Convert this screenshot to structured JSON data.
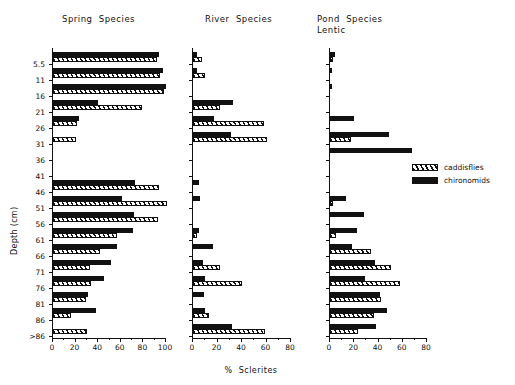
{
  "chart_data": {
    "type": "bar",
    "orientation": "horizontal",
    "title": "",
    "xlabel": "% Sclerites",
    "ylabel": "Depth (cm)",
    "grid": false,
    "legend_position": "right",
    "categories": [
      "5.5",
      "11",
      "16",
      "21",
      "26",
      "31",
      "36",
      "41",
      "46",
      "51",
      "56",
      "61",
      "66",
      "71",
      "76",
      "81",
      "86",
      ">86"
    ],
    "legend": [
      {
        "name": "caddisflies",
        "fill": "hatched"
      },
      {
        "name": "chironomids",
        "fill": "solid"
      }
    ],
    "panels": [
      {
        "title": "Spring  Species",
        "xlim": [
          0,
          100
        ],
        "xticks": [
          0,
          20,
          40,
          60,
          80,
          100
        ],
        "xticklabels": [
          "0",
          "20",
          "40",
          "60",
          "80",
          "100"
        ],
        "series": [
          {
            "name": "chironomids",
            "values": [
              94,
              97,
              100,
              40,
              23,
              0,
              0,
              0,
              73,
              61,
              72,
              71,
              57,
              51,
              45,
              31,
              38,
              0
            ]
          },
          {
            "name": "caddisflies",
            "values": [
              92,
              95,
              98,
              79,
              21,
              20,
              0,
              0,
              94,
              101,
              93,
              57,
              42,
              33,
              34,
              29,
              16,
              30
            ]
          }
        ]
      },
      {
        "title": "River  Species",
        "xlim": [
          0,
          80
        ],
        "xticks": [
          0,
          20,
          40,
          60,
          80
        ],
        "xticklabels": [
          "0",
          "20",
          "40",
          "60",
          "80"
        ],
        "series": [
          {
            "name": "chironomids",
            "values": [
              3,
              3,
              0,
              33,
              17,
              31,
              0,
              0,
              5,
              6,
              0,
              5,
              16,
              8,
              10,
              9,
              10,
              32
            ]
          },
          {
            "name": "caddisflies",
            "values": [
              7,
              10,
              0,
              22,
              58,
              60,
              0,
              0,
              0,
              0,
              0,
              3,
              0,
              22,
              40,
              0,
              13,
              59
            ]
          }
        ]
      },
      {
        "title": "Pond  Species\nLentic",
        "xlim": [
          0,
          80
        ],
        "xticks": [
          0,
          20,
          40,
          60,
          80
        ],
        "xticklabels": [
          "0",
          "20",
          "40",
          "60",
          "80"
        ],
        "series": [
          {
            "name": "chironomids",
            "values": [
              4,
              2,
              2,
              0,
              20,
              49,
              68,
              0,
              0,
              13,
              28,
              22,
              18,
              37,
              29,
              41,
              47,
              38
            ]
          },
          {
            "name": "caddisflies",
            "values": [
              2,
              0,
              0,
              0,
              0,
              17,
              0,
              0,
              0,
              2,
              0,
              5,
              34,
              50,
              58,
              42,
              36,
              23
            ]
          }
        ]
      }
    ]
  },
  "axis_titles": {
    "y": "Depth (cm)",
    "x": "%  Sclerites"
  }
}
